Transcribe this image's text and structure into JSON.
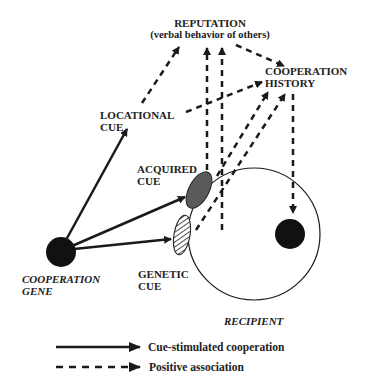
{
  "diagram": {
    "nodes": {
      "reputation": {
        "title": "REPUTATION",
        "subtitle": "(verbal behavior of others)"
      },
      "cooperation_history": {
        "line1": "COOPERATION",
        "line2": "HISTORY"
      },
      "locational_cue": {
        "line1": "LOCATIONAL",
        "line2": "CUE"
      },
      "acquired_cue": {
        "line1": "ACQUIRED",
        "line2": "CUE"
      },
      "genetic_cue": {
        "line1": "GENETIC",
        "line2": "CUE"
      },
      "cooperation_gene": {
        "line1": "COOPERATION",
        "line2": "GENE"
      },
      "recipient": {
        "label": "RECIPIENT"
      }
    },
    "edges": [
      {
        "from": "cooperation_gene",
        "to": "locational_cue",
        "type": "solid"
      },
      {
        "from": "cooperation_gene",
        "to": "acquired_cue",
        "type": "solid"
      },
      {
        "from": "cooperation_gene",
        "to": "genetic_cue",
        "type": "solid"
      },
      {
        "from": "locational_cue",
        "to": "reputation",
        "type": "dashed"
      },
      {
        "from": "locational_cue",
        "to": "cooperation_history",
        "type": "dashed"
      },
      {
        "from": "acquired_cue",
        "to": "reputation",
        "type": "dashed"
      },
      {
        "from": "acquired_cue",
        "to": "cooperation_history",
        "type": "dashed"
      },
      {
        "from": "genetic_cue",
        "to": "reputation",
        "type": "dashed"
      },
      {
        "from": "genetic_cue",
        "to": "cooperation_history",
        "type": "dashed"
      },
      {
        "from": "reputation",
        "to": "cooperation_history",
        "type": "dashed"
      },
      {
        "from": "cooperation_history",
        "to": "recipient",
        "type": "dashed"
      }
    ],
    "colors": {
      "ink": "#1a1a1a",
      "acquired_fill": "#5a5a5a"
    }
  },
  "legend": {
    "solid_label": "Cue-stimulated cooperation",
    "dashed_label": "Positive association"
  }
}
